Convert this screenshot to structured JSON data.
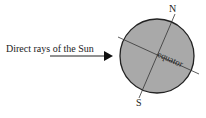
{
  "diagram": {
    "rays_label": "Direct rays of the Sun",
    "north_label": "N",
    "south_label": "S",
    "equator_label": "equator",
    "colors": {
      "earth_fill": "#a9a9a9",
      "outline": "#222222",
      "background": "#ffffff"
    }
  }
}
